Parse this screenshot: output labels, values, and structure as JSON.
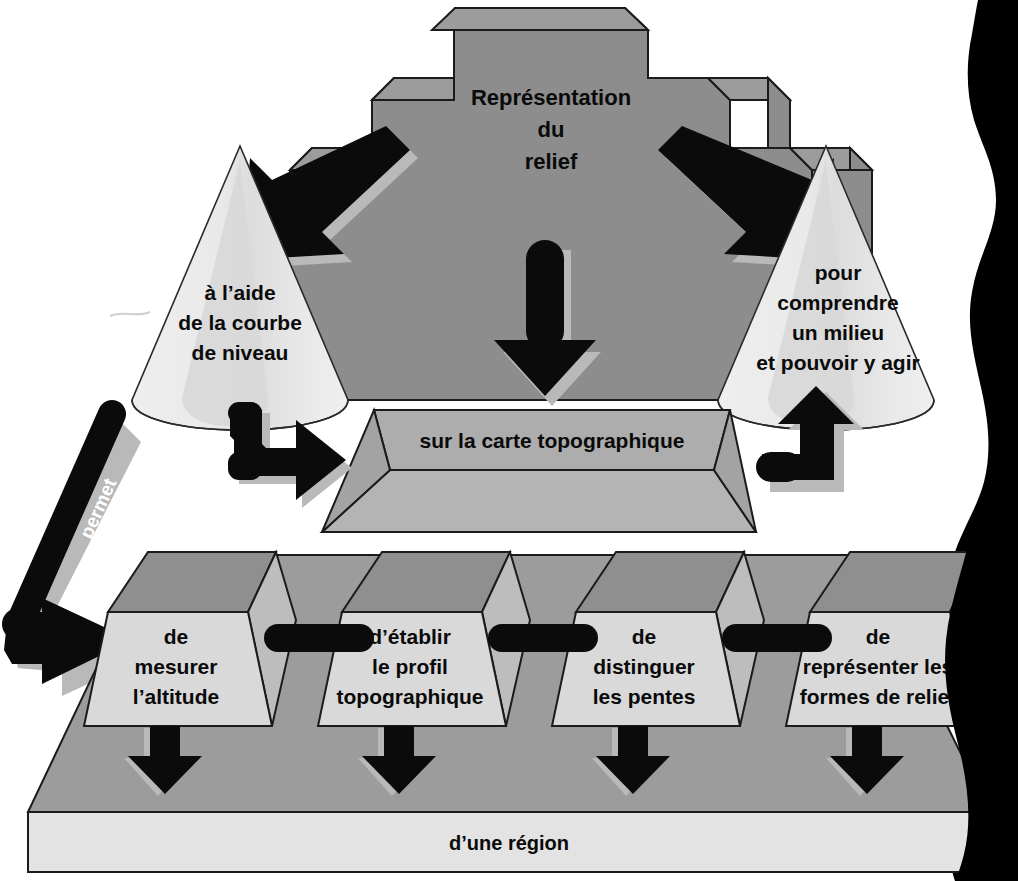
{
  "diagram": {
    "title_block": {
      "label": "Représentation\ndu\nrelief",
      "line1": "Représentation",
      "line2": "du",
      "line3": "relief"
    },
    "left_cone": {
      "line1": "à l’aide",
      "line2": "de la courbe",
      "line3": "de niveau"
    },
    "right_cone": {
      "line1": "pour",
      "line2": "comprendre",
      "line3": "un milieu",
      "line4": "et pouvoir y agir"
    },
    "middle_slab": {
      "label": "sur la carte topographique"
    },
    "connector_label": {
      "text": "permet"
    },
    "action_blocks": [
      {
        "line1": "de",
        "line2": "mesurer",
        "line3": "l’altitude"
      },
      {
        "line1": "d’établir",
        "line2": "le profil",
        "line3": "topographique"
      },
      {
        "line1": "de",
        "line2": "distinguer",
        "line3": "les pentes",
        "line4": ""
      },
      {
        "line1": "de",
        "line2": "représenter les",
        "line3": "formes de relief"
      }
    ],
    "base_slab": {
      "label": "d’une région"
    },
    "colors": {
      "background": "#ffffff",
      "pyramid_gray": "#8d8d8d",
      "pyramid_top_gray": "#9a9a9a",
      "cone_light": "#e6e6e6",
      "cone_shade": "#d0d0d0",
      "slab_top": "#a9a9a9",
      "slab_front": "#b4b4b4",
      "block_top": "#8f8f8f",
      "block_front": "#d9d9d9",
      "block_side": "#bdbdbd",
      "base_top": "#9c9c9c",
      "base_front": "#e3e3e3",
      "arrow_black": "#0b0b0b",
      "arrow_shadow": "#b9b9b9",
      "edge_stroke": "#1b1b1b",
      "scan_edge_black": "#000000",
      "text_dark": "#0a0a0a",
      "text_light": "#ffffff"
    }
  }
}
